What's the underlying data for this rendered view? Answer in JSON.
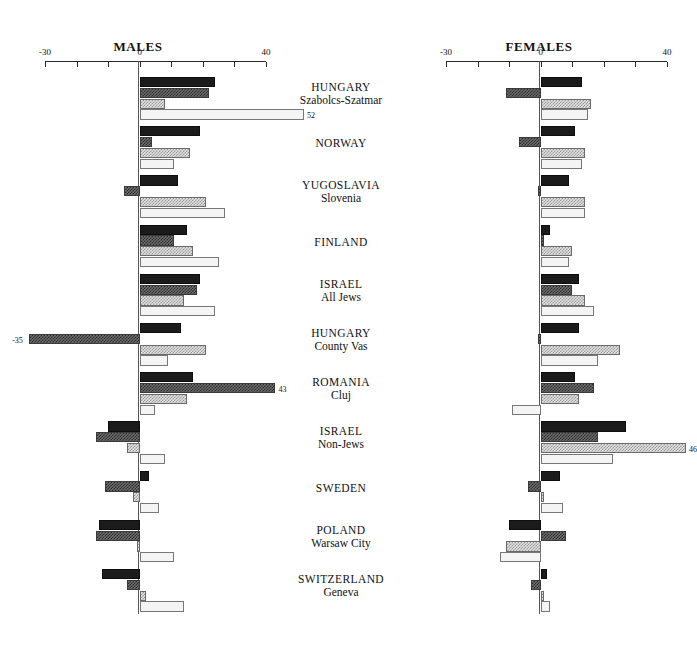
{
  "figure": {
    "top_fragment": "",
    "panels": [
      {
        "key": "males",
        "title": "MALES"
      },
      {
        "key": "females",
        "title": "FEMALES"
      }
    ]
  },
  "axis": {
    "ticks": [
      -30,
      -20,
      -10,
      0,
      10,
      20,
      30,
      40
    ],
    "tick_labels_shown": [
      "-30",
      "0",
      "40"
    ],
    "min": -30,
    "max": 40
  },
  "categories": [
    {
      "main": "HUNGARY",
      "sub": "Szabolcs-Szatmar"
    },
    {
      "main": "NORWAY",
      "sub": ""
    },
    {
      "main": "YUGOSLAVIA",
      "sub": "Slovenia"
    },
    {
      "main": "FINLAND",
      "sub": ""
    },
    {
      "main": "ISRAEL",
      "sub": "All Jews"
    },
    {
      "main": "HUNGARY",
      "sub": "County Vas"
    },
    {
      "main": "ROMANIA",
      "sub": "Cluj"
    },
    {
      "main": "ISRAEL",
      "sub": "Non-Jews"
    },
    {
      "main": "SWEDEN",
      "sub": ""
    },
    {
      "main": "POLAND",
      "sub": "Warsaw City"
    },
    {
      "main": "SWITZERLAND",
      "sub": "Geneva"
    }
  ],
  "chart_data": {
    "type": "bar",
    "title": "",
    "xlabel": "",
    "ylabel": "",
    "orientation": "horizontal",
    "grid": false,
    "legend": "none",
    "xlim": [
      -30,
      40
    ],
    "xticks": [
      -30,
      -20,
      -10,
      0,
      10,
      20,
      30,
      40
    ],
    "categories": [
      "HUNGARY Szabolcs-Szatmar",
      "NORWAY",
      "YUGOSLAVIA Slovenia",
      "FINLAND",
      "ISRAEL All Jews",
      "HUNGARY County Vas",
      "ROMANIA Cluj",
      "ISRAEL Non-Jews",
      "SWEDEN",
      "POLAND Warsaw City",
      "SWITZERLAND Geneva"
    ],
    "panels": [
      {
        "name": "MALES",
        "series": [
          {
            "name": "bar-1",
            "fill": "solid-black",
            "values": [
              24,
              19,
              12,
              15,
              19,
              13,
              17,
              -10,
              3,
              -13,
              -12
            ]
          },
          {
            "name": "bar-2",
            "fill": "dark-hatch",
            "values": [
              22,
              4,
              -5,
              11,
              18,
              -35,
              43,
              -14,
              -11,
              -14,
              -4
            ]
          },
          {
            "name": "bar-3",
            "fill": "light-hatch",
            "values": [
              8,
              16,
              21,
              17,
              14,
              21,
              15,
              -4,
              -2,
              -1,
              2
            ]
          },
          {
            "name": "bar-4",
            "fill": "white",
            "values": [
              52,
              11,
              27,
              25,
              24,
              9,
              5,
              8,
              6,
              11,
              14
            ]
          }
        ],
        "value_annotations": [
          {
            "category": "HUNGARY Szabolcs-Szatmar",
            "series": "bar-4",
            "label": "52"
          },
          {
            "category": "HUNGARY County Vas",
            "series": "bar-2",
            "label": "-35"
          },
          {
            "category": "ROMANIA Cluj",
            "series": "bar-2",
            "label": "43"
          }
        ]
      },
      {
        "name": "FEMALES",
        "series": [
          {
            "name": "bar-1",
            "fill": "solid-black",
            "values": [
              13,
              11,
              9,
              3,
              12,
              12,
              11,
              27,
              6,
              -10,
              2
            ]
          },
          {
            "name": "bar-2",
            "fill": "dark-hatch",
            "values": [
              -11,
              -7,
              -1,
              1,
              10,
              -1,
              17,
              18,
              -4,
              8,
              -3
            ]
          },
          {
            "name": "bar-3",
            "fill": "light-hatch",
            "values": [
              16,
              14,
              14,
              10,
              14,
              25,
              12,
              46,
              1,
              -11,
              1
            ]
          },
          {
            "name": "bar-4",
            "fill": "white",
            "values": [
              15,
              13,
              14,
              9,
              17,
              18,
              -9,
              23,
              7,
              -13,
              3
            ]
          }
        ],
        "value_annotations": [
          {
            "category": "ISRAEL Non-Jews",
            "series": "bar-3",
            "label": "46"
          }
        ]
      }
    ]
  }
}
